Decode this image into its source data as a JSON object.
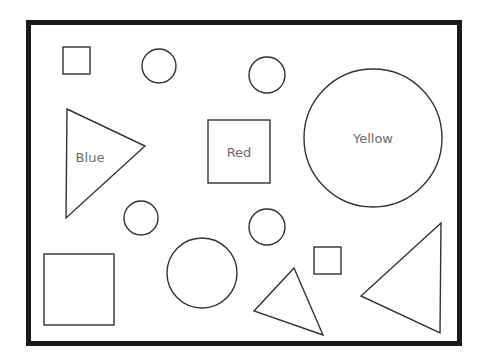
{
  "diagram": {
    "frame": {
      "x": 28.5,
      "y": 22.5,
      "width": 431,
      "height": 321,
      "color": "#1a1a1a"
    },
    "stroke_color": "#333333",
    "label_color": "#6b6b6b",
    "squares": [
      {
        "id": "small-square-top-left",
        "x": 63,
        "y": 47,
        "width": 27,
        "height": 27,
        "label": ""
      },
      {
        "id": "red-square",
        "x": 208,
        "y": 120,
        "width": 62,
        "height": 63,
        "label": "Red"
      },
      {
        "id": "large-square-bottom-left",
        "x": 44,
        "y": 254,
        "width": 70,
        "height": 71,
        "label": ""
      },
      {
        "id": "small-square-bottom",
        "x": 314,
        "y": 247,
        "width": 27,
        "height": 27,
        "label": ""
      }
    ],
    "circles": [
      {
        "id": "circle-top-1",
        "cx": 159,
        "cy": 66,
        "r": 17,
        "label": ""
      },
      {
        "id": "circle-top-2",
        "cx": 267,
        "cy": 75,
        "r": 18,
        "label": ""
      },
      {
        "id": "yellow-circle",
        "cx": 373,
        "cy": 138,
        "r": 69,
        "label": "Yellow"
      },
      {
        "id": "circle-mid-left",
        "cx": 141,
        "cy": 218,
        "r": 17,
        "label": ""
      },
      {
        "id": "circle-mid-right",
        "cx": 267,
        "cy": 227,
        "r": 18,
        "label": ""
      },
      {
        "id": "circle-bottom-medium",
        "cx": 202,
        "cy": 273,
        "r": 35,
        "label": ""
      }
    ],
    "triangles": [
      {
        "id": "blue-triangle",
        "points": "67,109 145,146 66,218",
        "label": "Blue",
        "label_x": 90,
        "label_y": 158
      },
      {
        "id": "triangle-bottom-middle",
        "points": "294,268 254,311 323,335",
        "label": ""
      },
      {
        "id": "triangle-bottom-right",
        "points": "441,223 361,296 440,333",
        "label": ""
      }
    ],
    "labels": {
      "blue": "Blue",
      "red": "Red",
      "yellow": "Yellow"
    }
  }
}
